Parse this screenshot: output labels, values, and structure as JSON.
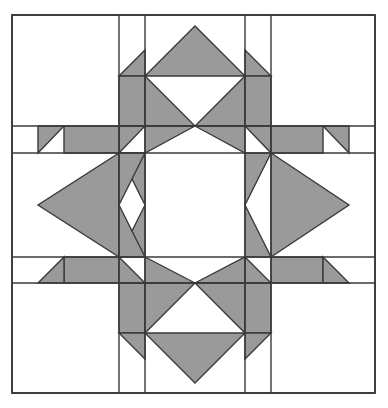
{
  "canvas": {
    "width": 388,
    "height": 408,
    "background": "#ffffff"
  },
  "block": {
    "title": "Quilt Block Pattern",
    "pattern_name": "eight-pointed-star-quilt-block",
    "description": "Symmetric pieced quilt block diagram: white background square with gray half-square-triangle chevrons pointing inward on all four sides around an open white center.",
    "fill_gray": "#9a9a9a",
    "fill_white": "#ffffff",
    "stroke": "#3a3a3a",
    "stroke_width": 1.4,
    "outer_stroke_width": 1.8
  },
  "grid": {
    "x": [
      12,
      119,
      145,
      245,
      271,
      375
    ],
    "y": [
      15,
      126,
      153,
      257,
      283,
      393
    ],
    "columns": [
      "corner-left",
      "narrow-left",
      "center-wide",
      "narrow-right",
      "corner-right"
    ],
    "rows": [
      "corner-top",
      "narrow-top",
      "center-wide",
      "narrow-bottom",
      "corner-bottom"
    ]
  },
  "grid_lines": {
    "vertical": [
      {
        "name": "v-outer-left",
        "x": 12,
        "y1": 15,
        "y2": 393
      },
      {
        "name": "v-inner-left-a",
        "x": 119,
        "y1": 15,
        "y2": 393
      },
      {
        "name": "v-inner-left-b",
        "x": 145,
        "y1": 15,
        "y2": 393
      },
      {
        "name": "v-inner-right-a",
        "x": 245,
        "y1": 15,
        "y2": 393
      },
      {
        "name": "v-inner-right-b",
        "x": 271,
        "y1": 15,
        "y2": 393
      },
      {
        "name": "v-outer-right",
        "x": 375,
        "y1": 15,
        "y2": 393
      }
    ],
    "horizontal": [
      {
        "name": "h-outer-top",
        "y": 15,
        "x1": 12,
        "x2": 375
      },
      {
        "name": "h-inner-top-a",
        "y": 126,
        "x1": 12,
        "x2": 375
      },
      {
        "name": "h-inner-top-b",
        "y": 153,
        "x1": 12,
        "x2": 375
      },
      {
        "name": "h-inner-bottom-a",
        "y": 257,
        "x1": 12,
        "x2": 375
      },
      {
        "name": "h-inner-bottom-b",
        "y": 283,
        "x1": 12,
        "x2": 375
      },
      {
        "name": "h-outer-bottom",
        "y": 393,
        "x1": 12,
        "x2": 375
      }
    ]
  },
  "gray_shapes": [
    {
      "name": "top-small-tri-left-upper",
      "points": "119,76 145,50 145,76"
    },
    {
      "name": "top-large-tri-center-upper",
      "points": "145,76 195,26 245,76"
    },
    {
      "name": "top-small-tri-right-upper",
      "points": "245,50 271,76 245,76"
    },
    {
      "name": "top-band-left-chevron",
      "points": "119,76 145,76 145,126 119,126"
    },
    {
      "name": "top-left-diag-lower",
      "points": "119,126 145,126 119,153"
    },
    {
      "name": "top-center-chevron-left",
      "points": "145,76 195,126 145,126"
    },
    {
      "name": "top-center-chevron-left-low",
      "points": "145,126 195,126 145,153"
    },
    {
      "name": "top-center-chevron-right",
      "points": "245,76 245,126 195,126"
    },
    {
      "name": "top-center-chevron-right-low",
      "points": "245,126 245,153 195,126"
    },
    {
      "name": "top-band-right-chevron",
      "points": "245,76 271,76 271,126 245,126"
    },
    {
      "name": "top-right-diag-lower",
      "points": "245,126 271,126 271,153"
    },
    {
      "name": "left-small-tri-upper",
      "points": "38,126 64,126 38,153"
    },
    {
      "name": "left-band-upper",
      "points": "64,126 119,126 119,153 64,153"
    },
    {
      "name": "left-large-tri",
      "points": "119,153 119,257 38,205"
    },
    {
      "name": "left-chevron-inner-upper",
      "points": "119,153 145,153 145,205"
    },
    {
      "name": "left-chevron-inner-lower",
      "points": "119,257 145,257 145,205"
    },
    {
      "name": "left-chevron-outer-upper",
      "points": "119,153 145,153 119,205"
    },
    {
      "name": "left-chevron-outer-lower",
      "points": "119,257 145,257 119,205"
    },
    {
      "name": "left-band-lower",
      "points": "64,257 119,257 119,283 64,283"
    },
    {
      "name": "left-small-tri-lower",
      "points": "38,283 64,257 64,283"
    },
    {
      "name": "right-small-tri-upper",
      "points": "349,126 323,126 349,153"
    },
    {
      "name": "right-band-upper",
      "points": "271,126 323,126 323,153 271,153"
    },
    {
      "name": "right-large-tri",
      "points": "271,153 271,257 349,205"
    },
    {
      "name": "right-chevron-inner-upper",
      "points": "245,153 271,153 245,205"
    },
    {
      "name": "right-chevron-inner-lower",
      "points": "245,257 271,257 245,205"
    },
    {
      "name": "right-band-lower",
      "points": "271,257 323,257 323,283 271,283"
    },
    {
      "name": "right-small-tri-lower",
      "points": "349,283 323,257 323,283"
    },
    {
      "name": "bottom-band-left-chevron",
      "points": "119,283 145,283 145,333 119,333"
    },
    {
      "name": "bottom-left-diag-upper",
      "points": "119,257 145,283 119,283"
    },
    {
      "name": "bottom-center-chevron-left",
      "points": "145,283 195,283 145,333"
    },
    {
      "name": "bottom-center-chevron-left-up",
      "points": "145,257 195,283 145,283"
    },
    {
      "name": "bottom-center-chevron-right",
      "points": "245,283 245,333 195,283"
    },
    {
      "name": "bottom-center-chevron-right-up",
      "points": "245,257 245,283 195,283"
    },
    {
      "name": "bottom-band-right-chevron",
      "points": "245,283 271,283 271,333 245,333"
    },
    {
      "name": "bottom-right-diag-upper",
      "points": "245,257 271,283 245,283"
    },
    {
      "name": "bottom-small-tri-left-lower",
      "points": "119,333 145,333 145,359"
    },
    {
      "name": "bottom-large-tri-center-lower",
      "points": "145,333 245,333 195,383"
    },
    {
      "name": "bottom-small-tri-right-lower",
      "points": "245,333 271,333 245,359"
    }
  ],
  "labels": {
    "caption": ""
  }
}
